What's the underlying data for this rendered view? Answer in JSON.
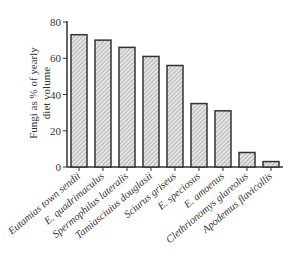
{
  "chart_data": {
    "type": "bar",
    "title": "",
    "xlabel": "",
    "ylabel": "Fungi as % of yearly diet volume",
    "ylabel_lines": [
      "Fungi as % of yearly",
      "diet volume"
    ],
    "ylim": [
      0,
      80
    ],
    "yticks": [
      0,
      20,
      40,
      60,
      80
    ],
    "grid": false,
    "legend": null,
    "categories": [
      "Eutamias town sendii",
      "E. quadrimaculus",
      "Spermophilus lateralis",
      "Tamiasciuius douglasii",
      "Sciurus griseus",
      "E. speciosus",
      "E. amoenus",
      "Clethrionomys glareolus",
      "Apodemus flavicollis"
    ],
    "values": [
      73,
      70,
      66,
      61,
      56,
      35,
      31,
      8,
      3
    ],
    "bar_style": {
      "fill": "#d9d9d9",
      "hatch": "diagonal",
      "edge": "#333333"
    }
  }
}
